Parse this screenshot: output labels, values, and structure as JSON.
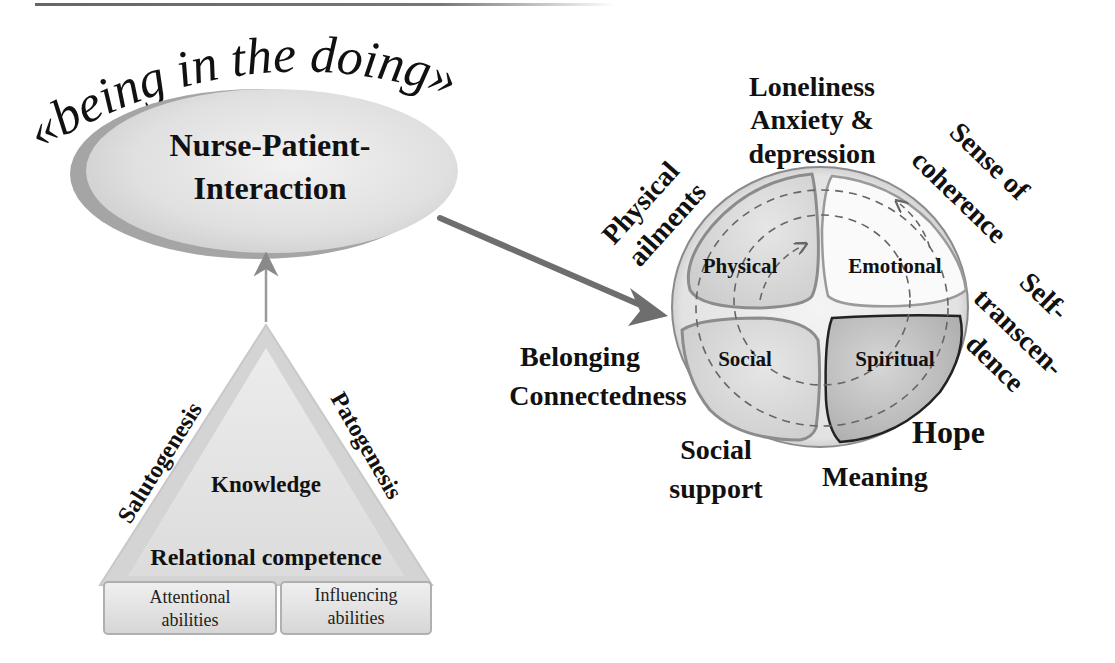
{
  "title": {
    "arc_text": "«being in the doing»"
  },
  "interaction": {
    "line1": "Nurse-Patient-",
    "line2": "Interaction"
  },
  "triangle": {
    "left_side": "Salutogenesis",
    "right_side": "Patogenesis",
    "center": "Knowledge",
    "base": "Relational competence",
    "boxes": [
      {
        "line1": "Attentional",
        "line2": "abilities"
      },
      {
        "line1": "Influencing",
        "line2": "abilities"
      }
    ]
  },
  "sphere": {
    "quadrants": [
      {
        "label": "Physical"
      },
      {
        "label": "Emotional"
      },
      {
        "label": "Social"
      },
      {
        "label": "Spiritual"
      }
    ]
  },
  "outer_labels": {
    "physical": {
      "line1": "Physical",
      "line2": "ailments"
    },
    "emotional": {
      "line1": "Loneliness",
      "line2": "Anxiety &",
      "line3": "depression"
    },
    "coherence": {
      "line1": "Sense of",
      "line2": "coherence"
    },
    "transcendence": {
      "line1": "Self-",
      "line2": "transcen-",
      "line3": "dence"
    },
    "hope": "Hope",
    "meaning": "Meaning",
    "social_support": {
      "line1": "Social",
      "line2": "support"
    },
    "belonging": {
      "line1": "Belonging",
      "line2": "Connectedness"
    }
  },
  "colors": {
    "ellipse_fill": "#e4e4e4",
    "ellipse_shadow": "#9a9a9a",
    "arrow": "#6e6e6e",
    "quadrant_border": "#8c8c8c",
    "spiritual_border": "#222222",
    "text": "#111111"
  }
}
